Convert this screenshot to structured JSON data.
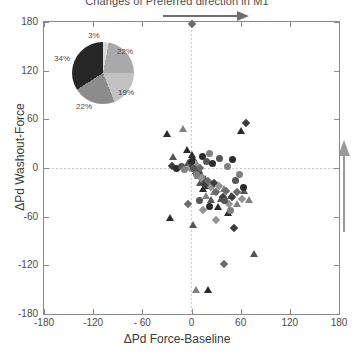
{
  "chart_data": {
    "type": "scatter",
    "title": "Changes of Preferred direction in M1",
    "xlabel": "ΔPd Force-Baseline",
    "ylabel": "ΔPd Washout-Force",
    "xlim": [
      -180,
      180
    ],
    "ylim": [
      -180,
      180
    ],
    "xticks": [
      "-180",
      "-120",
      "- 60",
      "0",
      "60",
      "120",
      "180"
    ],
    "yticks": [
      "180",
      "120",
      "60",
      "0",
      "-60",
      "-120",
      "-180"
    ],
    "grid": false,
    "reference_lines": {
      "x": 0,
      "y": 0,
      "style": "dotted"
    },
    "legend": "none",
    "annotations": [
      {
        "name": "horizontal-arrow",
        "direction": "right",
        "position": "above-plot"
      },
      {
        "name": "vertical-arrow",
        "direction": "up",
        "position": "right-of-plot"
      }
    ],
    "series": [
      {
        "name": "triangles",
        "marker": "triangle",
        "points": [
          [
            -30,
            42
          ],
          [
            -22,
            14
          ],
          [
            -10,
            48
          ],
          [
            -6,
            22
          ],
          [
            -4,
            6
          ],
          [
            -2,
            2
          ],
          [
            0,
            16
          ],
          [
            1,
            8
          ],
          [
            2,
            4
          ],
          [
            3,
            10
          ],
          [
            4,
            0
          ],
          [
            5,
            6
          ],
          [
            6,
            -4
          ],
          [
            7,
            2
          ],
          [
            8,
            -10
          ],
          [
            9,
            -2
          ],
          [
            10,
            -18
          ],
          [
            12,
            -8
          ],
          [
            14,
            -26
          ],
          [
            16,
            -14
          ],
          [
            18,
            -34
          ],
          [
            20,
            -22
          ],
          [
            24,
            -40
          ],
          [
            28,
            -30
          ],
          [
            32,
            -48
          ],
          [
            36,
            -38
          ],
          [
            40,
            -26
          ],
          [
            44,
            -56
          ],
          [
            48,
            -34
          ],
          [
            55,
            -44
          ],
          [
            60,
            46
          ],
          [
            64,
            -28
          ],
          [
            70,
            -40
          ],
          [
            -26,
            -62
          ],
          [
            2,
            -70
          ],
          [
            6,
            -150
          ],
          [
            20,
            -150
          ],
          [
            76,
            -106
          ]
        ]
      },
      {
        "name": "diamonds",
        "marker": "diamond",
        "points": [
          [
            0,
            178
          ],
          [
            -2,
            0
          ],
          [
            2,
            2
          ],
          [
            4,
            -2
          ],
          [
            6,
            4
          ],
          [
            8,
            -6
          ],
          [
            10,
            0
          ],
          [
            12,
            -12
          ],
          [
            16,
            -20
          ],
          [
            20,
            -16
          ],
          [
            24,
            -24
          ],
          [
            28,
            -18
          ],
          [
            30,
            -30
          ],
          [
            34,
            -22
          ],
          [
            38,
            -36
          ],
          [
            42,
            -28
          ],
          [
            46,
            -44
          ],
          [
            50,
            -36
          ],
          [
            56,
            -30
          ],
          [
            62,
            -38
          ],
          [
            66,
            56
          ],
          [
            -4,
            -44
          ],
          [
            30,
            -64
          ],
          [
            52,
            -74
          ],
          [
            40,
            -118
          ],
          [
            14,
            -52
          ],
          [
            -24,
            2
          ]
        ]
      },
      {
        "name": "circles",
        "marker": "circle",
        "points": [
          [
            -18,
            0
          ],
          [
            -12,
            2
          ],
          [
            -8,
            -2
          ],
          [
            0,
            8
          ],
          [
            3,
            0
          ],
          [
            6,
            -8
          ],
          [
            14,
            14
          ],
          [
            18,
            8
          ],
          [
            22,
            18
          ],
          [
            26,
            6
          ],
          [
            34,
            12
          ],
          [
            44,
            2
          ],
          [
            50,
            10
          ],
          [
            54,
            -16
          ],
          [
            58,
            -8
          ],
          [
            64,
            -24
          ],
          [
            40,
            -40
          ],
          [
            48,
            -52
          ],
          [
            22,
            -48
          ],
          [
            10,
            -40
          ]
        ]
      }
    ],
    "inset_pie": {
      "type": "pie",
      "slices": [
        {
          "label": "3%",
          "value": 3,
          "color": "#d8d8d8"
        },
        {
          "label": "22%",
          "value": 22,
          "color": "#a9a9a9"
        },
        {
          "label": "19%",
          "value": 19,
          "color": "#c2c2c2"
        },
        {
          "label": "22%",
          "value": 22,
          "color": "#8c8c8c"
        },
        {
          "label": "34%",
          "value": 34,
          "color": "#262626"
        }
      ]
    }
  }
}
